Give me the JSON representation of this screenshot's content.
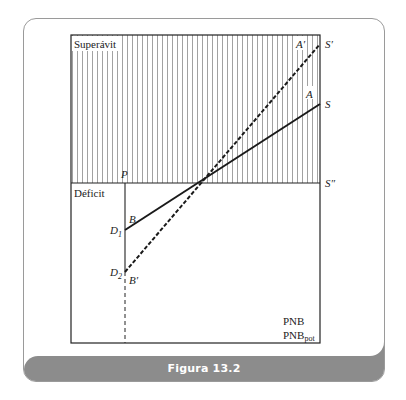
{
  "figure": {
    "caption": "Figura 13.2",
    "colors": {
      "footer_bg": "#8c8c8c",
      "line": "#222222",
      "hatch": "#888888"
    }
  },
  "diagram": {
    "regions": {
      "upper": "Superávit",
      "lower": "Déficit"
    },
    "axis_labels": {
      "x_line1": "PNB",
      "x_line2_base": "PNB",
      "x_line2_sub": "pot",
      "vertical_marker": "P"
    },
    "points": {
      "A": "A",
      "A_prime": "A′",
      "B": "B",
      "B_prime": "B′",
      "S": "S",
      "S_prime": "S′",
      "S_double_prime": "S″",
      "D1_base": "D",
      "D1_sub": "1",
      "D2_base": "D",
      "D2_sub": "2"
    },
    "lines": [
      {
        "name": "solid-budget-line",
        "from": "D1 (B)",
        "to": "S (A)",
        "style": "solid"
      },
      {
        "name": "dashed-budget-line",
        "from": "D2 (B′)",
        "to": "S′ (A′)",
        "style": "dashed"
      },
      {
        "name": "zero-balance-line",
        "from": "left axis",
        "to": "S″",
        "style": "solid"
      },
      {
        "name": "potential-gnp-line",
        "at": "P",
        "style": "solid above D2, dashed below"
      }
    ]
  }
}
